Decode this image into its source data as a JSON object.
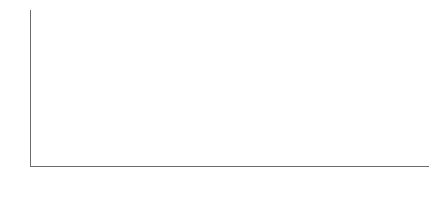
{
  "unit_caption": "単位：万トン",
  "legend": {
    "position": "top-right",
    "items": [
      {
        "label": "産業廃棄物",
        "color": "#a8b4c4",
        "swatch": "sangyo"
      },
      {
        "label": "一般廃棄物",
        "color": "#2b3f6b",
        "swatch": "ippan"
      }
    ]
  },
  "yaxis": {
    "ticks": [
      "60000",
      "50000",
      "40000",
      "30000",
      "20000",
      "10000",
      "0"
    ],
    "min": 0,
    "max": 60000,
    "step": 10000
  },
  "chart_data": {
    "type": "bar",
    "stacked": true,
    "title": "",
    "subtitle": "",
    "xlabel": "",
    "ylabel": "",
    "unit": "単位：万トン",
    "ylim": [
      0,
      60000
    ],
    "ytick_step": 10000,
    "grid": true,
    "legend_position": "top-right",
    "categories": [
      "平成5年",
      "平成6年",
      "平成7年",
      "平成8年",
      "平成9年",
      "平成10年",
      "平成11年",
      "平成12年",
      "平成13年",
      "平成14年",
      "平成15年",
      "平成16年",
      "平成17年",
      "平成18年",
      "平成19年",
      "平成20年",
      "平成21年",
      "平成22年",
      "平成23年"
    ],
    "series": [
      {
        "name": "産業廃棄物",
        "color": "#a8b4c4",
        "values": [
          39400,
          40200,
          39000,
          41800,
          40800,
          40300,
          39600,
          40000,
          39500,
          38400,
          40300,
          41000,
          41400,
          41000,
          40700,
          40000,
          38000,
          37300,
          37000
        ]
      },
      {
        "name": "一般廃棄物",
        "color": "#2b3f6b",
        "values": [
          5600,
          5300,
          5700,
          5600,
          5400,
          5500,
          5100,
          5600,
          5700,
          6100,
          5600,
          5200,
          5300,
          5100,
          5300,
          4600,
          5200,
          5200,
          5000
        ]
      }
    ],
    "totals": [
      45000,
      45500,
      44700,
      47400,
      46200,
      45800,
      44700,
      45600,
      45200,
      44500,
      45900,
      46200,
      46700,
      46100,
      46000,
      44600,
      43200,
      42500,
      42000
    ]
  }
}
